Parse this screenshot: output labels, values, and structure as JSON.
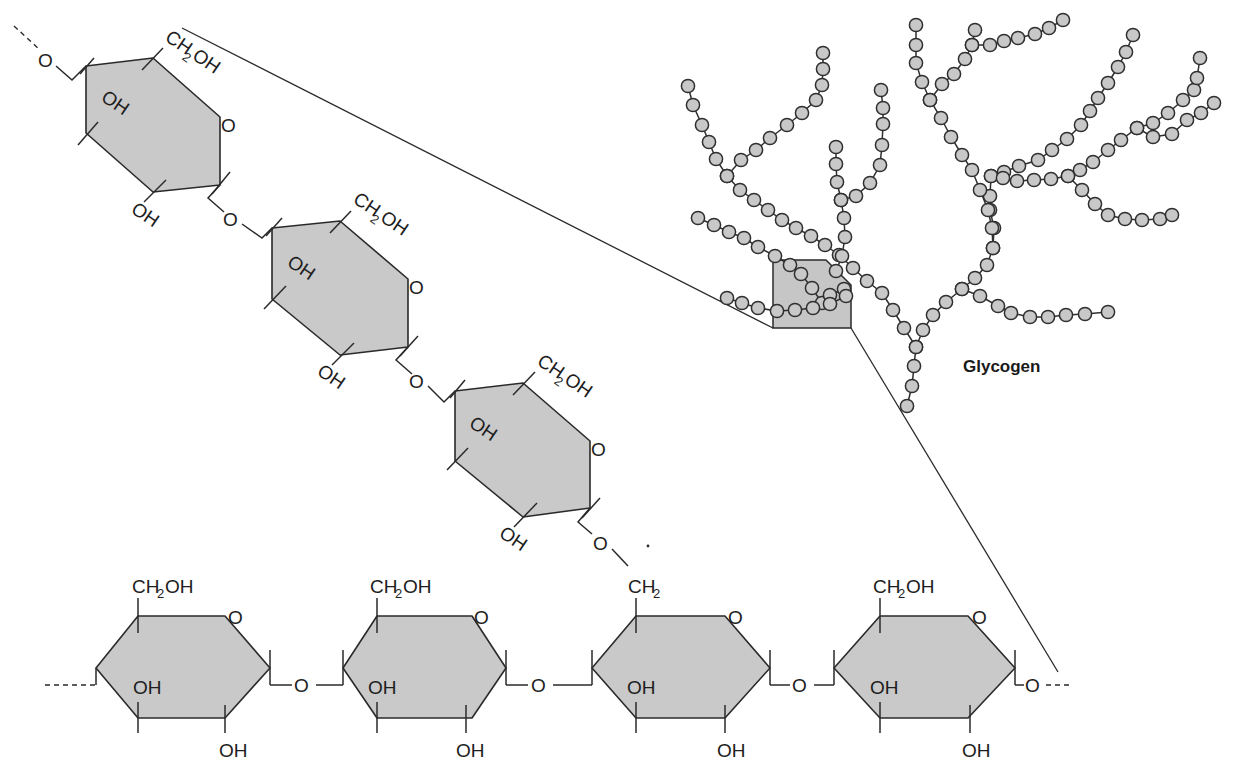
{
  "figure": {
    "title": "Glycogen",
    "colors": {
      "ring_fill": "#c9c9c9",
      "line": "#2a2a2a",
      "bead_fill": "#c8c8c8",
      "background": "#ffffff"
    }
  },
  "labels": {
    "ch2oh_main": "CH",
    "ch2oh_sub": "2",
    "ch2oh_tail": "OH",
    "ch2_main": "CH",
    "ch2_sub": "2",
    "oh": "OH",
    "o": "O"
  },
  "branch_chain": {
    "description": "alpha(1-4) linked glucose units in a diagonal branch",
    "units": [
      {
        "id": "b1",
        "substituents": [
          "CH2OH",
          "OH",
          "OH",
          "O"
        ]
      },
      {
        "id": "b2",
        "substituents": [
          "CH2OH",
          "OH",
          "OH",
          "O"
        ]
      },
      {
        "id": "b3",
        "substituents": [
          "CH2OH",
          "OH",
          "OH",
          "O"
        ]
      }
    ]
  },
  "main_chain": {
    "description": "horizontal alpha(1-4) chain with an alpha(1-6) branch point",
    "units": [
      {
        "id": "m1",
        "top": "CH2OH"
      },
      {
        "id": "m2",
        "top": "CH2OH"
      },
      {
        "id": "m3",
        "top": "CH2",
        "branch_point": true
      },
      {
        "id": "m4",
        "top": "CH2OH"
      }
    ]
  },
  "glycogen": {
    "label": "Glycogen",
    "bead_count_approx": 150,
    "highlight_box": "magnified region"
  }
}
